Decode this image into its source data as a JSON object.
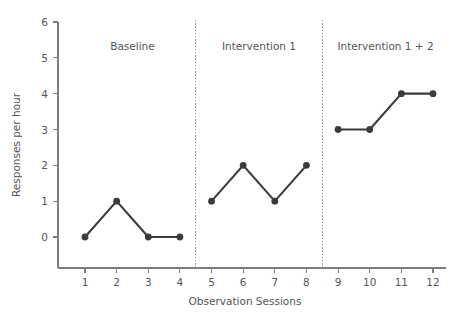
{
  "chart_data": {
    "type": "line",
    "title": "",
    "xlabel": "Observation Sessions",
    "ylabel": "Responses per hour",
    "xlim": [
      0.5,
      12.5
    ],
    "ylim": [
      0,
      6
    ],
    "grid": false,
    "legend": "none",
    "x": [
      1,
      2,
      3,
      4,
      5,
      6,
      7,
      8,
      9,
      10,
      11,
      12
    ],
    "xticks": [
      "1",
      "2",
      "3",
      "4",
      "5",
      "6",
      "7",
      "8",
      "9",
      "10",
      "11",
      "12"
    ],
    "yticks": [
      "0",
      "1",
      "2",
      "3",
      "4",
      "5",
      "6"
    ],
    "series": [
      {
        "name": "Baseline",
        "x": [
          1,
          2,
          3,
          4
        ],
        "values": [
          0,
          1,
          0,
          0
        ]
      },
      {
        "name": "Intervention 1",
        "x": [
          5,
          6,
          7,
          8
        ],
        "values": [
          1,
          2,
          1,
          2
        ]
      },
      {
        "name": "Intervention 1 + 2",
        "x": [
          9,
          10,
          11,
          12
        ],
        "values": [
          3,
          3,
          4,
          4
        ]
      }
    ],
    "phases": [
      {
        "label": "Baseline",
        "center_x": 2.5
      },
      {
        "label": "Intervention 1",
        "center_x": 6.5
      },
      {
        "label": "Intervention 1 + 2",
        "center_x": 10.5
      }
    ],
    "phase_dividers": [
      4.5,
      8.5
    ],
    "colors": {
      "series": "#3b3b3b",
      "axis": "#7d7d7d",
      "phase_divider": "#9a9a9a",
      "text": "#555555",
      "background": "#ffffff"
    }
  }
}
